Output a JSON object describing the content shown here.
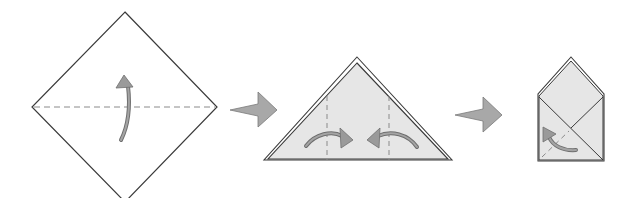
{
  "diagram": {
    "title": "",
    "type": "origami-instructions",
    "colors": {
      "background": "#ffffff",
      "outline": "#3a3a3a",
      "paper_fill": "#e6e6e6",
      "paper_fill_light": "#ffffff",
      "arrow_fill": "#9a9a9a",
      "arrow_stroke": "#6e6e6e",
      "dashed": "#8a8a8a"
    },
    "steps": [
      {
        "id": "step-1",
        "shape": "diamond-square",
        "fold": "valley-fold-bottom-to-top",
        "crease": "horizontal-dashed",
        "arrow": "curved-up-arrow"
      },
      {
        "id": "step-2",
        "shape": "triangle",
        "fold": "fold-sides-to-center",
        "creases": [
          "left-vertical-dashed",
          "right-vertical-dashed"
        ],
        "arrows": [
          "curved-right-arrow",
          "curved-left-arrow"
        ]
      },
      {
        "id": "step-3",
        "shape": "envelope-pentagon",
        "fold": "fold-corner-up",
        "crease": "diagonal-dashed",
        "arrow": "curved-up-left-arrow"
      }
    ],
    "transitions": [
      {
        "from": "step-1",
        "to": "step-2",
        "icon": "right-arrow-icon"
      },
      {
        "from": "step-2",
        "to": "step-3",
        "icon": "right-arrow-icon"
      }
    ]
  }
}
